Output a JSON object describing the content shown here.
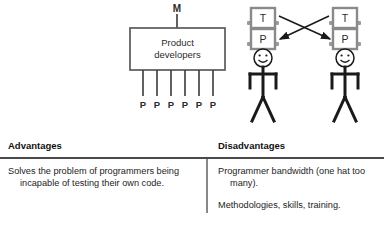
{
  "diagram": {
    "manager_label": "M",
    "box_line1": "Product",
    "box_line2": "developers",
    "programmer_labels": [
      "P",
      "P",
      "P",
      "P",
      "P",
      "P"
    ],
    "figures": [
      {
        "hat_top_label": "T",
        "hat_bottom_label": "P"
      },
      {
        "hat_top_label": "T",
        "hat_bottom_label": "P"
      }
    ],
    "colors": {
      "box_stroke": "#5a5a5a",
      "line": "#3a3a3a",
      "hat_stroke": "#8a8a8a",
      "figure": "#1a1a1a"
    }
  },
  "table": {
    "headers": [
      "Advantages",
      "Disadvantages"
    ],
    "rows": [
      {
        "advantages": [
          "Solves the problem of programmers being incapable of testing their own code."
        ],
        "disadvantages": [
          "Programmer bandwidth (one hat too many).",
          "Methodologies, skills, training."
        ]
      }
    ]
  }
}
